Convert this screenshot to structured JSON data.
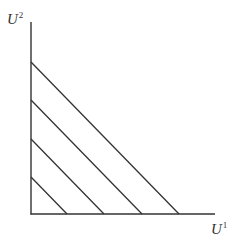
{
  "diagram": {
    "title": "",
    "axes": {
      "y_label": {
        "base": "U",
        "superscript": "2"
      },
      "x_label": {
        "base": "U",
        "superscript": "1"
      }
    },
    "colors": {
      "line": "#333333",
      "text": "#333333",
      "background": "#ffffff"
    },
    "geometry": {
      "origin": [
        31,
        214
      ],
      "y_axis_top": [
        31,
        22
      ],
      "x_axis_end": [
        215,
        214
      ]
    },
    "parallel_lines": [
      {
        "id": "line-1",
        "y_intercept": 177,
        "x_intercept": 67
      },
      {
        "id": "line-2",
        "y_intercept": 139,
        "x_intercept": 104
      },
      {
        "id": "line-3",
        "y_intercept": 100,
        "x_intercept": 142
      },
      {
        "id": "line-4",
        "y_intercept": 62,
        "x_intercept": 179
      }
    ]
  }
}
